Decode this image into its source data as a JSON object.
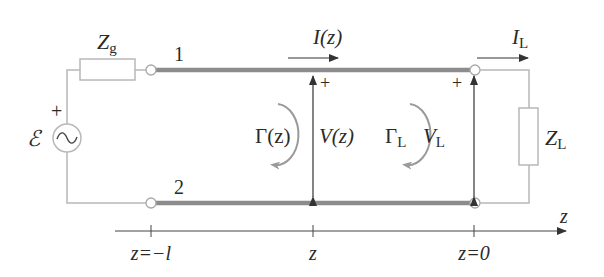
{
  "diagram": {
    "colors": {
      "line": "#8c8c8c",
      "wire": "#b8b8b8",
      "text": "#2a2a2a",
      "arrow": "#333333",
      "gamma_arrow": "#9a9a9a"
    },
    "source": {
      "emf_label": "ℰ",
      "polarity": "+",
      "icon": "ac-source-icon",
      "symbol": "~"
    },
    "generator_impedance": {
      "label": "Z",
      "subscript": "g"
    },
    "load_impedance": {
      "label": "Z",
      "subscript": "L"
    },
    "conductors": [
      {
        "label": "1"
      },
      {
        "label": "2"
      }
    ],
    "current": {
      "line": {
        "label": "I(z)"
      },
      "load": {
        "label": "I",
        "subscript": "L"
      }
    },
    "voltage": {
      "line": {
        "label": "V(z)",
        "polarity": "+"
      },
      "load": {
        "label": "V",
        "subscript": "L",
        "polarity": "+"
      }
    },
    "reflection": {
      "line": {
        "label": "Γ(z)"
      },
      "load": {
        "label": "Γ",
        "subscript": "L"
      }
    },
    "axis": {
      "label": "z",
      "ticks": [
        {
          "label": "z=−l"
        },
        {
          "label": "z"
        },
        {
          "label": "z=0"
        }
      ]
    }
  }
}
